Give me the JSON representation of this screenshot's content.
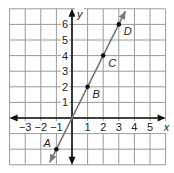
{
  "chart_data": {
    "type": "line",
    "title": "",
    "xlabel": "x",
    "ylabel": "y",
    "xlim": [
      -4,
      6
    ],
    "ylim": [
      -3,
      7
    ],
    "grid": true,
    "x_ticks": [
      "-3",
      "-2",
      "-1",
      "1",
      "2",
      "3",
      "4",
      "5"
    ],
    "y_ticks": [
      "1",
      "2",
      "3",
      "4",
      "5",
      "6"
    ],
    "line": {
      "slope": 2,
      "intercept": 0,
      "color": "#777777"
    },
    "points": [
      {
        "label": "A",
        "x": -1,
        "y": -2
      },
      {
        "label": "B",
        "x": 1,
        "y": 2
      },
      {
        "label": "C",
        "x": 2,
        "y": 4
      },
      {
        "label": "D",
        "x": 3,
        "y": 6
      }
    ]
  }
}
